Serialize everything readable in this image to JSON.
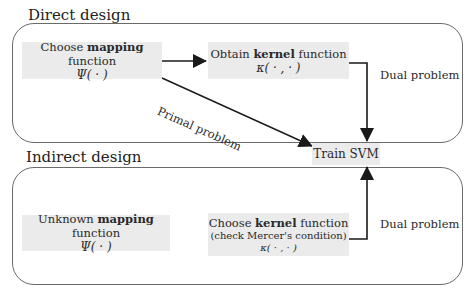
{
  "sections": {
    "direct": {
      "title": "Direct design"
    },
    "indirect": {
      "title": "Indirect design"
    }
  },
  "nodes": {
    "choose_mapping": {
      "prefix": "Choose ",
      "bold": "mapping",
      "suffix": " function",
      "symbol": "Ψ( · )"
    },
    "obtain_kernel": {
      "prefix": "Obtain ",
      "bold": "kernel",
      "suffix": " function",
      "symbol": "κ( · , · )"
    },
    "train_svm": {
      "label": "Train SVM"
    },
    "unknown_mapping": {
      "prefix": "Unknown ",
      "bold": "mapping",
      "suffix": " function",
      "symbol": "Ψ( · )"
    },
    "choose_kernel": {
      "prefix": "Choose ",
      "bold": "kernel",
      "suffix": " function",
      "note": "(check Mercer's condition)",
      "symbol": "κ( · , · )"
    }
  },
  "edges": {
    "primal": {
      "label": "Primal problem"
    },
    "dual_top": {
      "label": "Dual problem"
    },
    "dual_bottom": {
      "label": "Dual problem"
    }
  },
  "colors": {
    "node_fill": "#ebebeb",
    "border": "#6a6a6a",
    "arrow": "#1a1a1a"
  }
}
